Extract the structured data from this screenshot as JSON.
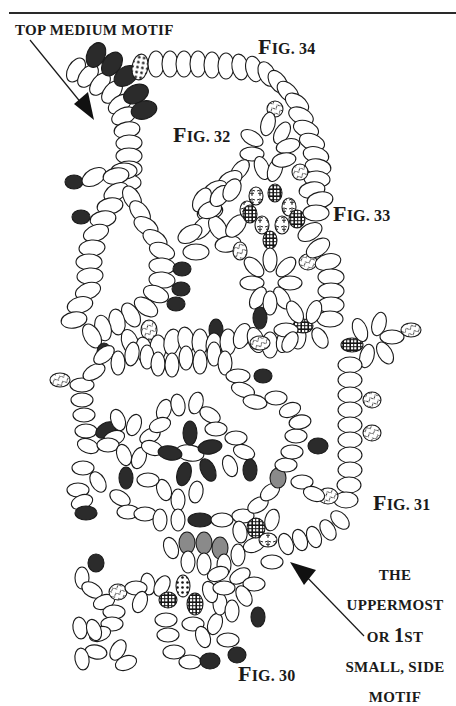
{
  "labels": {
    "top_motif": "TOP MEDIUM MOTIF",
    "fig34": {
      "F": "F",
      "rest": "IG. 34"
    },
    "fig32": {
      "F": "F",
      "rest": "IG. 32"
    },
    "fig33": {
      "F": "F",
      "rest": "IG. 33"
    },
    "fig31": {
      "F": "F",
      "rest": "IG. 31"
    },
    "fig30": {
      "F": "F",
      "rest": "IG. 30"
    },
    "side_caption": {
      "line1": "THE",
      "line2": "UPPERMOST",
      "line3_a": "OR ",
      "line3_b": "1",
      "line3_c": "ST",
      "line4": "SMALL, SIDE",
      "line5": "MOTIF"
    }
  },
  "figures": [
    "Fig. 30",
    "Fig. 31",
    "Fig. 32",
    "Fig. 33",
    "Fig. 34"
  ],
  "bead_legend": [
    {
      "type": "plain",
      "fill": "#ffffff",
      "description": "white bead"
    },
    {
      "type": "dark",
      "fill": "#2b2b2b",
      "description": "dark bead"
    },
    {
      "type": "gray",
      "fill": "#8a8a8a",
      "description": "medium gray bead"
    },
    {
      "type": "dotted",
      "fill": "#ffffff",
      "description": "dotted/speckled bead"
    },
    {
      "type": "grid",
      "fill": "#1a1a1a",
      "description": "checkered/grid bead"
    },
    {
      "type": "hatched",
      "fill": "#ffffff",
      "description": "hatched/script bead"
    },
    {
      "type": "floral",
      "fill": "#ffffff",
      "description": "floral-pattern bead"
    }
  ],
  "colors": {
    "ink": "#1a1a1a",
    "dark_bead": "#2b2b2b",
    "gray_bead": "#8a8a8a",
    "background": "#ffffff"
  }
}
